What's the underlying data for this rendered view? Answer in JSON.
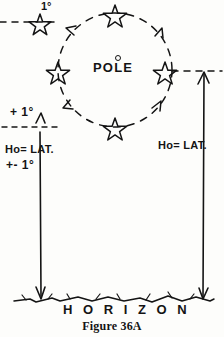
{
  "figure": {
    "caption": "Figure 36A",
    "ink_color": "#141414",
    "paper_color": "#fdfdfb"
  },
  "center_label": {
    "text": "POLE",
    "marker": "pole-dot"
  },
  "labels": {
    "top_star_degree": "1°",
    "left_plus_degree": "+ 1°",
    "left_ho_lat": "Ho= LAT.",
    "left_plus_minus_degree": "+-  1°",
    "right_ho_lat": "Ho= LAT.",
    "horizon": "H O R I Z O N"
  },
  "stars": [
    {
      "name": "star-top",
      "cx": 115,
      "cy": 13,
      "r": 8.5
    },
    {
      "name": "star-left",
      "cx": 58,
      "cy": 70,
      "r": 8.5
    },
    {
      "name": "star-right",
      "cx": 165,
      "cy": 70,
      "r": 8.5
    },
    {
      "name": "star-bottom",
      "cx": 115,
      "cy": 126,
      "r": 8.5
    },
    {
      "name": "star-upper-left-observed",
      "cx": 40,
      "cy": 22,
      "r": 8.0
    }
  ],
  "orbit": {
    "cx": 115,
    "cy": 70,
    "r": 57,
    "style": "dashed",
    "direction": "counterclockwise",
    "arrow_angles_deg": [
      140,
      50,
      220,
      320
    ]
  },
  "sight_lines": [
    {
      "name": "left-sight-line",
      "x": 40,
      "y_top": 130,
      "y_bottom": 300,
      "arrow": "down"
    },
    {
      "name": "right-sight-line",
      "x": 204,
      "y_top": 70,
      "y_bottom": 300,
      "arrow": "up"
    }
  ],
  "dashed_links": [
    {
      "name": "top-left-dash",
      "x1": 0,
      "y1": 22,
      "x2": 56,
      "y2": 22
    },
    {
      "name": "left-level-dash",
      "x1": 2,
      "y1": 127,
      "x2": 62,
      "y2": 127
    },
    {
      "name": "right-level-dash",
      "x1": 172,
      "y1": 71,
      "x2": 222,
      "y2": 71
    }
  ],
  "ground": {
    "name": "horizon-ground-line",
    "y": 300,
    "x_start": 14,
    "x_end": 214
  }
}
